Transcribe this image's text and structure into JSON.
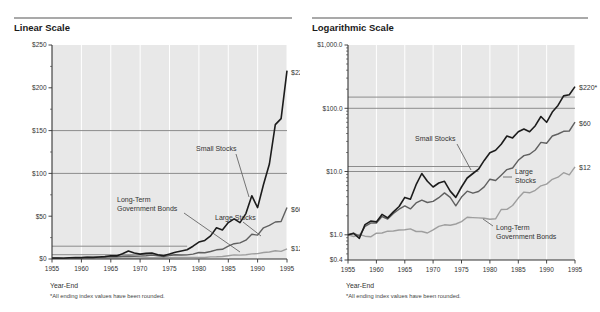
{
  "style": {
    "page_bg": "#ffffff",
    "plot_bg": "#e8e8e8",
    "axis_color": "#333333",
    "gridline_color": "#ffffff",
    "reference_line_color": "#8c8c8c",
    "leader_color": "#555555",
    "annotation_color": "#333333",
    "series_colors": {
      "small_stocks": "#1c1c1c",
      "large_stocks": "#606060",
      "bonds": "#9e9e9e"
    }
  },
  "charts": [
    {
      "title": "Linear Scale",
      "y_scale": "linear",
      "y_min": 0,
      "y_max": 250,
      "y_ticks": [
        {
          "label": "$250",
          "value": 250
        },
        {
          "label": "$200",
          "value": 200
        },
        {
          "label": "$150",
          "value": 150
        },
        {
          "label": "$100",
          "value": 100
        },
        {
          "label": "$50",
          "value": 50
        },
        {
          "label": "$0",
          "value": 0
        }
      ],
      "y_minor_ticks": [
        25,
        75,
        125,
        175,
        225
      ],
      "x_ticks": [
        1955,
        1960,
        1965,
        1970,
        1975,
        1980,
        1985,
        1990,
        1995
      ],
      "x_axis_label": "Year-End",
      "footnote": "*All ending index values have been rounded.",
      "reference_lines": [
        {
          "value": 150,
          "extent": "full"
        },
        {
          "value": 100,
          "extent": "full"
        },
        {
          "value": 15,
          "extent": "partial"
        },
        {
          "value": 5,
          "extent": "partial"
        }
      ],
      "reference_line_partial_end": 1978,
      "end_labels": [
        {
          "text": "$220*",
          "x": 291,
          "y": 75
        },
        {
          "text": "$60",
          "x": 291,
          "y": 212
        },
        {
          "text": "$12",
          "x": 291,
          "y": 251
        }
      ],
      "annotations": [
        {
          "lines": [
            "Small Stocks"
          ],
          "x": 196,
          "y": 151,
          "leader": [
            [
              236,
              154
            ],
            [
              249,
              197
            ]
          ]
        },
        {
          "lines": [
            "Long-Term",
            "Government Bonds"
          ],
          "x": 117,
          "y": 202,
          "leader": [
            [
              184,
              213
            ],
            [
              240,
              252
            ]
          ]
        },
        {
          "lines": [
            "Large Stocks"
          ],
          "x": 215,
          "y": 220,
          "leader": [
            [
              243,
              222
            ],
            [
              261,
              236
            ]
          ]
        }
      ]
    },
    {
      "title": "Logarithmic Scale",
      "y_scale": "log",
      "y_min": 0.4,
      "y_max": 1000,
      "y_ticks": [
        {
          "label": "$1,000.0",
          "value": 1000
        },
        {
          "label": "$100.0",
          "value": 100
        },
        {
          "label": "$10.0",
          "value": 10
        },
        {
          "label": "$1.0",
          "value": 1
        },
        {
          "label": "$0.4",
          "value": 0.4
        }
      ],
      "y_minor_ticks": [
        0.5,
        0.6,
        0.7,
        0.8,
        0.9,
        2,
        3,
        4,
        5,
        6,
        7,
        8,
        9,
        20,
        30,
        40,
        50,
        60,
        70,
        80,
        90,
        200,
        300,
        400,
        500,
        600,
        700,
        800,
        900
      ],
      "x_ticks": [
        1955,
        1960,
        1965,
        1970,
        1975,
        1980,
        1985,
        1990,
        1995
      ],
      "x_axis_label": "Year-End",
      "footnote": "*All ending index values have been rounded.",
      "reference_lines": [
        {
          "value": 150,
          "extent": "full"
        },
        {
          "value": 100,
          "extent": "full"
        },
        {
          "value": 12,
          "extent": "partial"
        },
        {
          "value": 10,
          "extent": "partial"
        }
      ],
      "reference_line_partial_end": 1978,
      "end_labels": [
        {
          "text": "$220*",
          "x": 279,
          "y": 90
        },
        {
          "text": "$60",
          "x": 279,
          "y": 126
        },
        {
          "text": "$12",
          "x": 279,
          "y": 170
        }
      ],
      "annotations": [
        {
          "lines": [
            "Small Stocks"
          ],
          "x": 115,
          "y": 141,
          "leader": [
            [
              157,
              144
            ],
            [
              171,
              170
            ]
          ]
        },
        {
          "lines": [
            "Large",
            "Stocks"
          ],
          "x": 215,
          "y": 174,
          "leader": [
            [
              212,
              177
            ],
            [
              203,
              177
            ]
          ]
        },
        {
          "lines": [
            "Long-Term",
            "Government Bonds"
          ],
          "x": 196,
          "y": 230,
          "leader": [
            [
              193,
              226
            ],
            [
              183,
              219
            ]
          ]
        }
      ]
    }
  ],
  "chart_data": {
    "type": "line",
    "x_label": "Year-End",
    "x_range": [
      1955,
      1995
    ],
    "x": [
      1955,
      1956,
      1957,
      1958,
      1959,
      1960,
      1961,
      1962,
      1963,
      1964,
      1965,
      1966,
      1967,
      1968,
      1969,
      1970,
      1971,
      1972,
      1973,
      1974,
      1975,
      1976,
      1977,
      1978,
      1979,
      1980,
      1981,
      1982,
      1983,
      1984,
      1985,
      1986,
      1987,
      1988,
      1989,
      1990,
      1991,
      1992,
      1993,
      1994,
      1995
    ],
    "series": [
      {
        "id": "small_stocks",
        "name": "Small Stocks",
        "color": "#1c1c1c",
        "width": 1.6,
        "end_label": "$220*",
        "ending_value": 220,
        "values": [
          1.0,
          1.05,
          0.88,
          1.45,
          1.65,
          1.6,
          2.1,
          1.85,
          2.3,
          2.8,
          3.9,
          3.65,
          6.2,
          9.3,
          7.0,
          5.7,
          6.6,
          7.0,
          4.9,
          3.9,
          5.7,
          7.9,
          9.3,
          10.9,
          15.0,
          19.8,
          21.7,
          27.0,
          36.5,
          34.0,
          42.5,
          47.0,
          42.5,
          53.0,
          74.0,
          60.0,
          87.0,
          111.0,
          157.0,
          164.0,
          220.0
        ]
      },
      {
        "id": "large_stocks",
        "name": "Large Stocks",
        "color": "#606060",
        "width": 1.4,
        "end_label": "$60",
        "ending_value": 60,
        "values": [
          1.0,
          1.07,
          0.95,
          1.36,
          1.53,
          1.54,
          1.95,
          1.78,
          2.18,
          2.54,
          2.86,
          2.57,
          3.19,
          3.54,
          3.24,
          3.37,
          3.86,
          4.59,
          3.91,
          2.88,
          3.95,
          4.89,
          4.54,
          4.83,
          5.72,
          7.58,
          7.21,
          8.75,
          10.72,
          11.39,
          15.06,
          17.85,
          18.78,
          21.93,
          28.84,
          27.94,
          36.47,
          39.24,
          43.2,
          43.76,
          60.22
        ]
      },
      {
        "id": "bonds",
        "name": "Long-Term Government Bonds",
        "color": "#9e9e9e",
        "width": 1.4,
        "end_label": "$12",
        "ending_value": 12,
        "values": [
          1.0,
          0.94,
          1.01,
          0.95,
          0.93,
          1.06,
          1.07,
          1.14,
          1.15,
          1.19,
          1.2,
          1.24,
          1.13,
          1.13,
          1.07,
          1.2,
          1.36,
          1.44,
          1.42,
          1.48,
          1.62,
          1.89,
          1.87,
          1.85,
          1.83,
          1.76,
          1.79,
          2.51,
          2.52,
          2.91,
          3.81,
          4.74,
          4.61,
          5.05,
          5.96,
          6.33,
          7.55,
          8.15,
          9.6,
          8.85,
          11.9
        ]
      }
    ]
  }
}
